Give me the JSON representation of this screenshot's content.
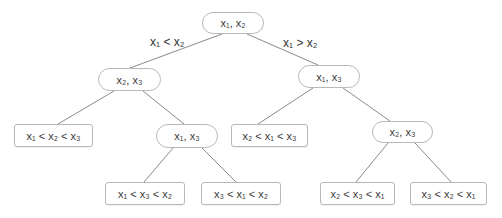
{
  "diagram": {
    "type": "decision-tree",
    "edge_color": "#8a8a8a",
    "nodes": [
      {
        "id": "root",
        "kind": "split",
        "label": "x₁, x₂",
        "box": [
          202,
          12,
          62,
          22
        ]
      },
      {
        "id": "l",
        "kind": "split",
        "label": "x₂, x₃",
        "box": [
          98,
          68,
          63,
          23
        ]
      },
      {
        "id": "r",
        "kind": "split",
        "label": "x₁, x₃",
        "box": [
          298,
          65,
          62,
          23
        ]
      },
      {
        "id": "ll",
        "kind": "leaf",
        "label": "x₁ < x₂ < x₃",
        "box": [
          14,
          124,
          79,
          23
        ]
      },
      {
        "id": "lr",
        "kind": "split",
        "label": "x₁, x₃",
        "box": [
          156,
          124,
          62,
          24
        ]
      },
      {
        "id": "rl",
        "kind": "leaf",
        "label": "x₂ < x₁ < x₃",
        "box": [
          231,
          124,
          77,
          23
        ]
      },
      {
        "id": "rr",
        "kind": "split",
        "label": "x₂, x₃",
        "box": [
          372,
          121,
          61,
          22
        ]
      },
      {
        "id": "lrl",
        "kind": "leaf",
        "label": "x₁ < x₃ < x₂",
        "box": [
          105,
          182,
          80,
          23
        ]
      },
      {
        "id": "lrr",
        "kind": "leaf",
        "label": "x₃ < x₁ < x₂",
        "box": [
          201,
          182,
          80,
          23
        ]
      },
      {
        "id": "rrl",
        "kind": "leaf",
        "label": "x₂ < x₃ < x₁",
        "box": [
          320,
          182,
          75,
          23
        ]
      },
      {
        "id": "rrr",
        "kind": "leaf",
        "label": "x₃ < x₂ < x₁",
        "box": [
          410,
          182,
          77,
          23
        ]
      }
    ],
    "edges": [
      {
        "from": "root",
        "to": "l",
        "label": "x₁ < x₂"
      },
      {
        "from": "root",
        "to": "r",
        "label": "x₁ > x₂"
      },
      {
        "from": "l",
        "to": "ll",
        "label": ""
      },
      {
        "from": "l",
        "to": "lr",
        "label": ""
      },
      {
        "from": "r",
        "to": "rl",
        "label": ""
      },
      {
        "from": "r",
        "to": "rr",
        "label": ""
      },
      {
        "from": "lr",
        "to": "lrl",
        "label": ""
      },
      {
        "from": "lr",
        "to": "lrr",
        "label": ""
      },
      {
        "from": "rr",
        "to": "rrl",
        "label": ""
      },
      {
        "from": "rr",
        "to": "rrr",
        "label": ""
      }
    ],
    "edge_labels": {
      "left": "x₁ < x₂",
      "right": "x₁ > x₂"
    }
  }
}
